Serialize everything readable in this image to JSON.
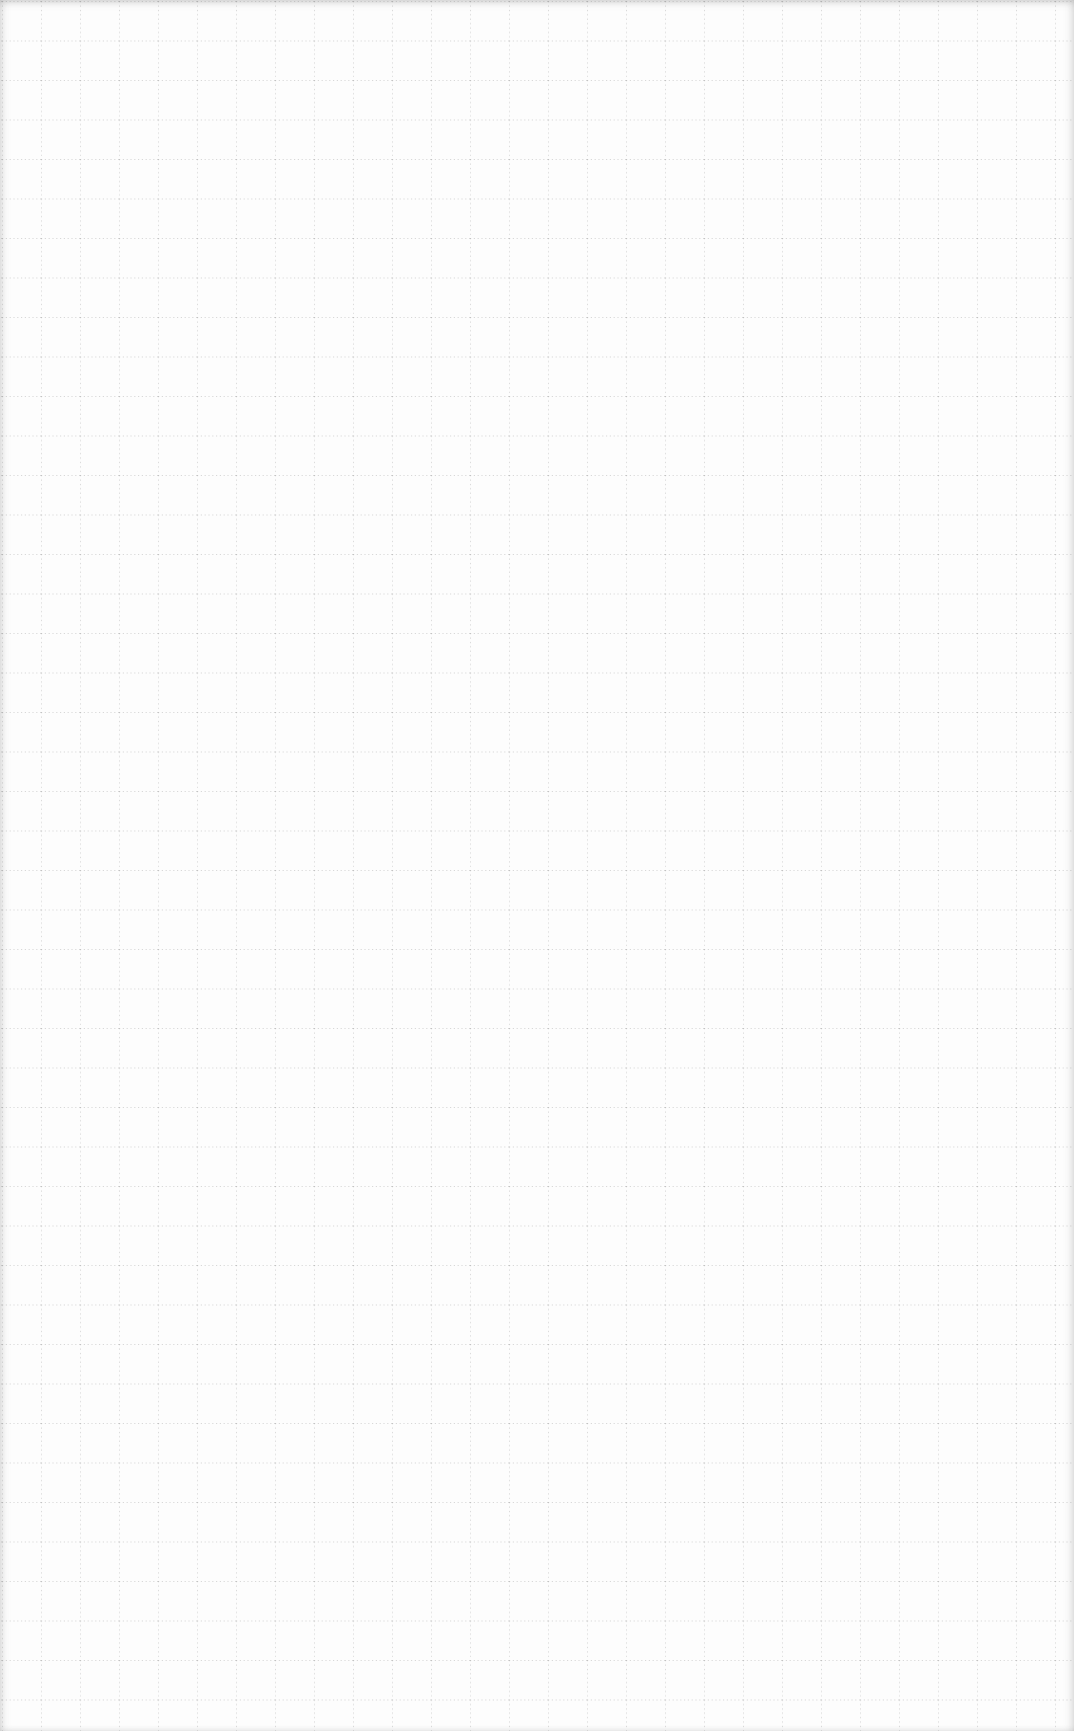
{
  "page": {
    "type": "grid-paper",
    "background_color": "#fdfdfd",
    "grid": {
      "style": "dotted",
      "line_color": "#a0a0a0",
      "cell_width_px": 39,
      "cell_height_px": 39.5,
      "offset_x_px": 2,
      "offset_y_px": 1
    },
    "text_content": []
  }
}
